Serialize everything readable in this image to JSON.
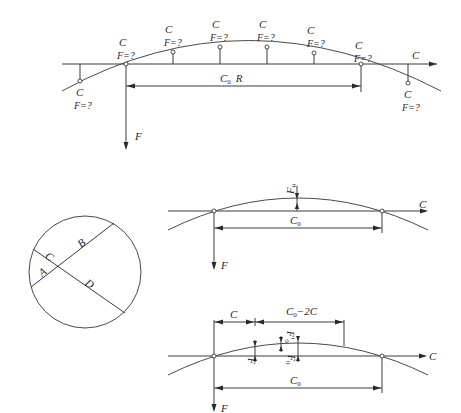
{
  "figure_top": {
    "point_label": "C",
    "force_query": "F=?",
    "chord_label": "C",
    "chord_sub": "0",
    "chord_radius_label": "R",
    "force_label": "F",
    "direction_label": "C"
  },
  "figure_circle": {
    "labels": {
      "A": "A",
      "B": "B",
      "C": "C",
      "D": "D"
    }
  },
  "figure_middle": {
    "sag_label": "F",
    "sag_sub": "0",
    "chord_label": "C",
    "chord_sub": "0",
    "force_label": "F",
    "direction_label": "C"
  },
  "figure_bottom": {
    "offset_label": "C",
    "inner_span_label": "C",
    "inner_span_sub": "0",
    "inner_span_suffix": "−2C",
    "sag_prime_label": "F",
    "sag_prime_sub": "0",
    "sag_prime_mark": "′",
    "sag_label": "F",
    "sag_sub": "0",
    "local_label": "F",
    "chord_label": "C",
    "chord_sub": "0",
    "force_label": "F",
    "direction_label": "C"
  }
}
